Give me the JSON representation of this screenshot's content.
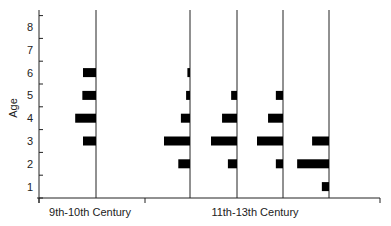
{
  "chart_data": {
    "type": "bar",
    "orientation": "horizontal-kite",
    "title": "",
    "xlabel": "",
    "ylabel": "Age",
    "y_ticks": [
      "1",
      "2",
      "3",
      "4",
      "5",
      "6",
      "7",
      "8"
    ],
    "ylim": [
      0,
      8
    ],
    "groups": [
      {
        "name": "9th-10th Century",
        "series_count": 1
      },
      {
        "name": "11th-13th Century",
        "series_count": 4
      }
    ],
    "series": [
      {
        "name": "9th-10th Century #1",
        "group": "9th-10th Century",
        "ages": [
          3,
          4,
          5,
          6
        ],
        "values": [
          2,
          3.2,
          2.1,
          2
        ]
      },
      {
        "name": "11th-13th Century #1",
        "group": "11th-13th Century",
        "ages": [
          2,
          3,
          4,
          5,
          6
        ],
        "values": [
          1.8,
          4,
          1.4,
          0.6,
          0.4
        ]
      },
      {
        "name": "11th-13th Century #2",
        "group": "11th-13th Century",
        "ages": [
          2,
          3,
          4,
          5
        ],
        "values": [
          1.4,
          4,
          2.3,
          0.9
        ]
      },
      {
        "name": "11th-13th Century #3",
        "group": "11th-13th Century",
        "ages": [
          2,
          3,
          4,
          5
        ],
        "values": [
          1.1,
          4,
          2.3,
          1.1
        ]
      },
      {
        "name": "11th-13th Century #4",
        "group": "11th-13th Century",
        "ages": [
          1,
          2,
          3
        ],
        "values": [
          1.1,
          4.9,
          2.6
        ]
      }
    ],
    "grid": false,
    "legend": "none"
  },
  "axis": {
    "ylabel": "Age",
    "group_labels": [
      "9th-10th Century",
      "11th-13th Century"
    ]
  }
}
